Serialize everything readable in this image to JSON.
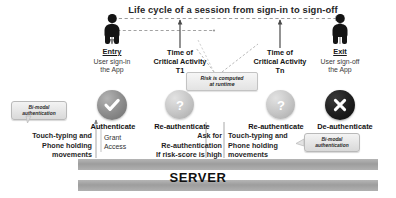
{
  "diagram": {
    "title": "Life cycle of a session from sign-in to sign-off",
    "server_label": "SERVER"
  },
  "stages": [
    {
      "id": "entry",
      "title": "Entry",
      "subtitle_line1": "User sign-in",
      "subtitle_line2": "the App",
      "icon": "person-icon",
      "badge_icon": "check-circle-icon",
      "action": "Authenticate",
      "modality_line1": "Touch-typing and",
      "modality_line2": "Phone holding",
      "modality_line3": "movements",
      "callout_line1": "Bi-modal",
      "callout_line2": "authentication"
    },
    {
      "id": "critical-t1",
      "title_line1": "Time of",
      "title_line2": "Critical Activity",
      "title_line3": "T1",
      "badge_icon": "question-circle-icon",
      "action": "Re-authenticate",
      "detail_line1": "Ask for",
      "detail_line2": "Re-authentication",
      "detail_line3": "If risk-score is high"
    },
    {
      "id": "critical-tn",
      "title_line1": "Time of",
      "title_line2": "Critical Activity",
      "title_line3": "Tn",
      "badge_icon": "question-circle-icon",
      "action": "Re-authenticate",
      "modality_line1": "Touch-typing and",
      "modality_line2": "Phone holding",
      "modality_line3": "movements",
      "callout_line1": "Bi-modal",
      "callout_line2": "authentication"
    },
    {
      "id": "exit",
      "title": "Exit",
      "subtitle_line1": "User sign-off",
      "subtitle_line2": "the App",
      "icon": "person-icon",
      "badge_icon": "x-circle-icon",
      "action": "De-authenticate"
    }
  ],
  "annotations": {
    "grant_access_line1": "Grant",
    "grant_access_line2": "Access",
    "risk_line1": "Risk is computed",
    "risk_line2": "at runtime"
  },
  "colors": {
    "ink": "#1a1a1a",
    "server_bar": "#a8a8a8",
    "callout_bg": "#e6e6e6",
    "arrow": "#8c8c8c"
  }
}
